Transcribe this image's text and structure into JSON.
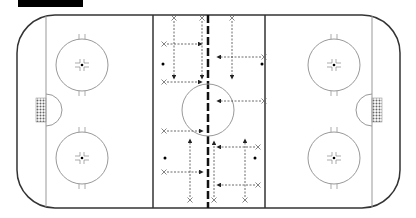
{
  "diagram": {
    "type": "hockey-rink-drill",
    "colors": {
      "board": "#333333",
      "line": "#999999",
      "drill": "#444444",
      "net": "#888888"
    },
    "rink": {
      "x": 17,
      "y": 15,
      "w": 383,
      "h": 193,
      "corner_r": 38,
      "goal_lines_x": [
        46,
        372
      ],
      "blue_lines_x": [
        153,
        265
      ],
      "center_line_x": 208,
      "center_circle": {
        "cx": 208,
        "cy": 110,
        "r": 26
      },
      "faceoff_circles": [
        {
          "cx": 82,
          "cy": 65
        },
        {
          "cx": 82,
          "cy": 158
        },
        {
          "cx": 334,
          "cy": 65
        },
        {
          "cx": 334,
          "cy": 158
        }
      ],
      "faceoff_r": 26
    },
    "players_x": [
      [
        174,
        18
      ],
      [
        202,
        18
      ],
      [
        232,
        18
      ],
      [
        164,
        44
      ],
      [
        264,
        57
      ],
      [
        164,
        82
      ],
      [
        264,
        101
      ],
      [
        164,
        131
      ],
      [
        258,
        147
      ],
      [
        164,
        172
      ],
      [
        258,
        185
      ],
      [
        190,
        200
      ],
      [
        214,
        200
      ],
      [
        245,
        200
      ]
    ],
    "pucks": [
      [
        163,
        64
      ],
      [
        262,
        64
      ],
      [
        165,
        158
      ],
      [
        255,
        158
      ]
    ],
    "passes": [
      {
        "from": [
          174,
          21
        ],
        "to": [
          174,
          78
        ]
      },
      {
        "from": [
          202,
          21
        ],
        "to": [
          202,
          78
        ]
      },
      {
        "from": [
          232,
          21
        ],
        "to": [
          232,
          78
        ]
      },
      {
        "from": [
          167,
          44
        ],
        "to": [
          201,
          44
        ]
      },
      {
        "from": [
          261,
          57
        ],
        "to": [
          218,
          57
        ]
      },
      {
        "from": [
          167,
          82
        ],
        "to": [
          201,
          82
        ]
      },
      {
        "from": [
          261,
          101
        ],
        "to": [
          218,
          101
        ]
      },
      {
        "from": [
          167,
          131
        ],
        "to": [
          202,
          131
        ]
      },
      {
        "from": [
          255,
          147
        ],
        "to": [
          218,
          147
        ]
      },
      {
        "from": [
          167,
          172
        ],
        "to": [
          202,
          172
        ]
      },
      {
        "from": [
          255,
          185
        ],
        "to": [
          218,
          185
        ]
      },
      {
        "from": [
          190,
          197
        ],
        "to": [
          190,
          140
        ]
      },
      {
        "from": [
          214,
          197
        ],
        "to": [
          214,
          142
        ]
      },
      {
        "from": [
          245,
          197
        ],
        "to": [
          245,
          140
        ]
      }
    ]
  }
}
